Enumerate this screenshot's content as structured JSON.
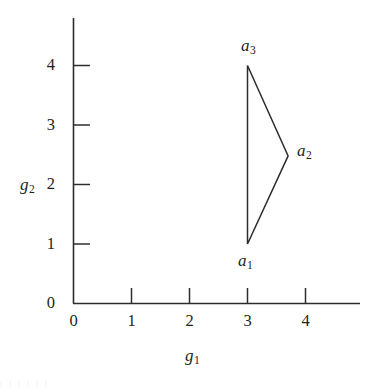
{
  "chart_data": {
    "type": "scatter",
    "title": "",
    "xlabel": "g1",
    "ylabel": "g2",
    "xlabel_base": "g",
    "xlabel_sub": "1",
    "ylabel_base": "g",
    "ylabel_sub": "2",
    "xlim": [
      0,
      4.95
    ],
    "ylim": [
      0,
      4.8
    ],
    "grid": false,
    "legend": null,
    "x_ticks": [
      0,
      1,
      2,
      3,
      4
    ],
    "y_ticks": [
      0,
      1,
      2,
      3,
      4
    ],
    "x_tick_labels": [
      "0",
      "1",
      "2",
      "3",
      "4"
    ],
    "y_tick_labels": [
      "0",
      "1",
      "2",
      "3",
      "4"
    ],
    "tick_direction": "in",
    "series": [
      {
        "name": "triangle",
        "shape": "closed-polygon",
        "stroke_color": "#2f2c2d",
        "fill": "none",
        "points": [
          {
            "label_base": "a",
            "label_sub": "1",
            "label": "a1",
            "x": 3.0,
            "y": 1.0,
            "label_pos": "below"
          },
          {
            "label_base": "a",
            "label_sub": "2",
            "label": "a2",
            "x": 3.7,
            "y": 2.48,
            "label_pos": "right"
          },
          {
            "label_base": "a",
            "label_sub": "3",
            "label": "a3",
            "x": 3.0,
            "y": 4.0,
            "label_pos": "above"
          }
        ]
      }
    ],
    "axis_color": "#2f2c2d",
    "background": "#ffffff"
  },
  "figure": {
    "bottom_smudge": "|        |     | |            | |"
  }
}
